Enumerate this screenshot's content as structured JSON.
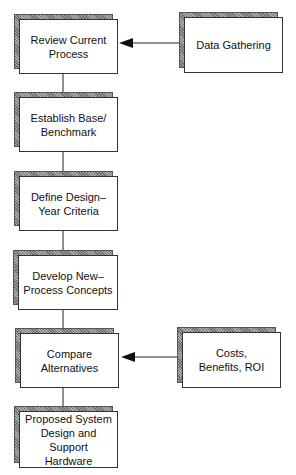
{
  "diagram": {
    "type": "flowchart",
    "steps": [
      {
        "id": "review",
        "label": "Review Current\nProcess"
      },
      {
        "id": "benchmark",
        "label": "Establish Base/\nBenchmark"
      },
      {
        "id": "criteria",
        "label": "Define Design–\nYear Criteria"
      },
      {
        "id": "concepts",
        "label": "Develop New–\nProcess Concepts"
      },
      {
        "id": "compare",
        "label": "Compare\nAlternatives"
      },
      {
        "id": "proposed",
        "label": "Proposed System\nDesign and Support\nHardware"
      }
    ],
    "inputs": [
      {
        "id": "data-gathering",
        "label": "Data Gathering",
        "feeds": "review"
      },
      {
        "id": "costs",
        "label": "Costs,\nBenefits, ROI",
        "feeds": "compare"
      }
    ],
    "edges": [
      {
        "from": "review",
        "to": "benchmark"
      },
      {
        "from": "benchmark",
        "to": "criteria"
      },
      {
        "from": "criteria",
        "to": "concepts"
      },
      {
        "from": "concepts",
        "to": "compare"
      },
      {
        "from": "compare",
        "to": "proposed"
      },
      {
        "from": "data-gathering",
        "to": "review",
        "arrow": true
      },
      {
        "from": "costs",
        "to": "compare",
        "arrow": true
      }
    ]
  }
}
